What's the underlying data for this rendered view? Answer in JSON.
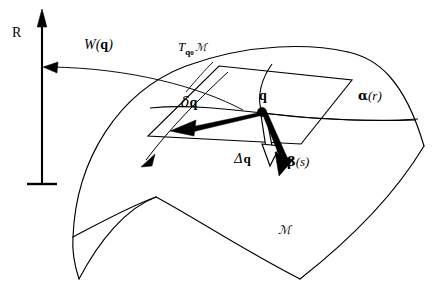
{
  "figure": {
    "name": "manifold-tangent-space-diagram",
    "stroke_color": "#000000",
    "background_color": "#ffffff",
    "width": 446,
    "height": 301
  },
  "labels": {
    "axis_r": "R",
    "potential_w": "W(",
    "potential_w_arg": "q",
    "potential_w_close": ")",
    "tangent_space_T": "T",
    "tangent_space_sub": "q",
    "tangent_space_sub_index": "0",
    "tangent_space_manifold": "ℳ",
    "point_q": "q",
    "variation_delta": "δ",
    "variation_q": "q",
    "increment_delta": "Δ",
    "increment_q": "q",
    "curve_alpha": "α",
    "curve_alpha_arg": "(r)",
    "curve_beta": "β",
    "curve_beta_arg": "(s)",
    "manifold": "ℳ"
  },
  "elements": {
    "r_axis": "vertical-arrow-axis",
    "w_arrow": "curved-arrow-pointing-to-r-axis",
    "tangent_plane": "parallelogram-tangent-plane",
    "manifold_surface": "curved-saddle-surface",
    "q_point": "filled-dot-on-surface",
    "delta_q_vector": "bold-arrow-in-tangent-plane",
    "delta_cap_q_vector": "outlined-arrow-downward",
    "beta_vector": "bold-arrow-downward-right",
    "alpha_curve": "curve-through-q-on-surface",
    "tangent_leader_line": "leader-line-from-T-label",
    "extra_arrow": "thin-arrow-lower-left"
  }
}
